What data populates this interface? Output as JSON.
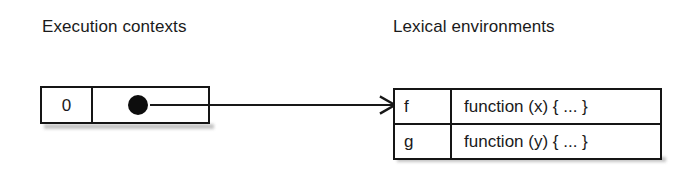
{
  "figure": {
    "background_color": "#ffffff",
    "ink_color": "#151515"
  },
  "headings": {
    "execution_contexts": "Execution contexts",
    "lexical_environments": "Lexical environments"
  },
  "execution_context_record": {
    "index_label": "0",
    "pointer_icon": "filled-dot-pointer"
  },
  "pointer_arrow": {
    "icon": "arrow-right-icon",
    "from": "execution-context-pointer",
    "to": "lexical-environment-table"
  },
  "lexical_environment": {
    "rows": [
      {
        "name": "f",
        "value": "function (x) { ... }"
      },
      {
        "name": "g",
        "value": "function (y) { ... }"
      }
    ]
  }
}
